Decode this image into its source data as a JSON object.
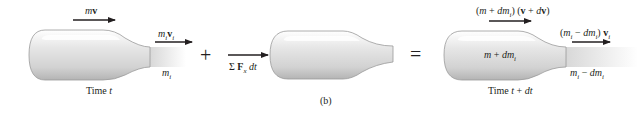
{
  "figure": {
    "caption": "(b)",
    "operators": {
      "plus": "+",
      "equals": "="
    },
    "panel_left": {
      "body_momentum_label": {
        "m": "m",
        "v": "v"
      },
      "exhaust_momentum_label": {
        "m": "m",
        "sub": "i",
        "v": "v",
        "vsub": "i"
      },
      "exhaust_mass_label": {
        "m": "m",
        "sub": "i"
      },
      "time_label": {
        "text": "Time ",
        "t": "t"
      }
    },
    "panel_middle": {
      "impulse_label": {
        "sigma": "Σ",
        "F": "F",
        "sub": "x",
        "dt": "dt"
      }
    },
    "panel_right": {
      "body_momentum_label": "(m + dm_i) (v + dv)",
      "body_momentum_parts": {
        "open": "(",
        "m": "m",
        "plus": " + ",
        "dm": "dm",
        "sub": "i",
        "close": ")",
        "open2": " (",
        "v": "v",
        "plus2": " + ",
        "d": "d",
        "v2": "v",
        "close2": ")"
      },
      "body_mass_label": {
        "m": "m",
        "plus": " + ",
        "dm": "dm",
        "sub": "i"
      },
      "exhaust_momentum_label": {
        "open": "(",
        "m": "m",
        "sub": "i",
        "minus": " − ",
        "dm": "dm",
        "sub2": "i",
        "close": ") ",
        "v": "v",
        "vsub": "i"
      },
      "exhaust_mass_label": {
        "m": "m",
        "sub": "i",
        "minus": " − ",
        "dm": "dm",
        "sub2": "i"
      },
      "time_label": {
        "text": "Time ",
        "t": "t",
        "plus": " + ",
        "dt": "dt"
      }
    },
    "colors": {
      "ink": "#231f20",
      "body_light": "#fafafa",
      "body_shadow": "#b8b8b8",
      "outline": "#9a9a9a"
    }
  }
}
